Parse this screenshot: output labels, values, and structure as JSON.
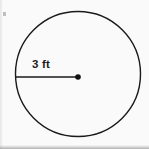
{
  "figure": {
    "kind": "geometry-diagram",
    "shape_name": "circle",
    "background_color": "#fafafa",
    "stroke_color": "#1a1a1a",
    "label_color": "#1c1c1c",
    "circle": {
      "center_x": 78,
      "center_y": 74,
      "radius_px": 62.5,
      "stroke_width": 1.4,
      "fill": "none"
    },
    "radius_segment": {
      "x1": 15,
      "y1": 77,
      "x2": 78,
      "y2": 77,
      "stroke_width": 1.6
    },
    "center_point": {
      "cx": 78,
      "cy": 77,
      "r": 2.8
    },
    "radius_label": {
      "text": "3 ft",
      "value": "3",
      "unit": "ft",
      "font_size_px": 11.5,
      "bold": true
    }
  }
}
